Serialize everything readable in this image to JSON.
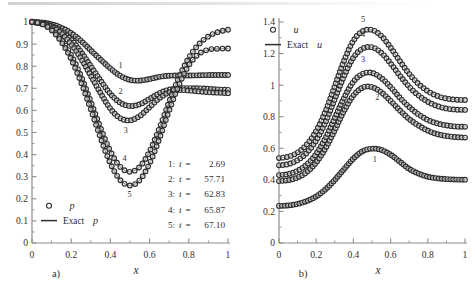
{
  "figure": {
    "panels": [
      {
        "id": "a",
        "panel_label": "a)",
        "xlabel": "x",
        "legend": [
          {
            "symbol": "o",
            "label": "p"
          },
          {
            "symbol": "line",
            "label": "Exact p"
          }
        ],
        "time_legend_rows": [
          {
            "index": "1:",
            "var": "t",
            "eq": "=",
            "value": "2.69"
          },
          {
            "index": "2:",
            "var": "t",
            "eq": "=",
            "value": "57.71"
          },
          {
            "index": "3:",
            "var": "t",
            "eq": "=",
            "value": "62.83"
          },
          {
            "index": "4:",
            "var": "t",
            "eq": "=",
            "value": "65.87"
          },
          {
            "index": "5:",
            "var": "t",
            "eq": "=",
            "value": "67.10"
          }
        ],
        "curve_numbers": [
          "1",
          "2",
          "3",
          "4",
          "5"
        ]
      },
      {
        "id": "b",
        "panel_label": "b)",
        "xlabel": "x",
        "legend": [
          {
            "symbol": "o",
            "label": "u"
          },
          {
            "symbol": "line",
            "label": "Exact u"
          }
        ],
        "curve_numbers": [
          "1",
          "2",
          "3",
          "4",
          "5"
        ]
      }
    ]
  },
  "chart_data": [
    {
      "type": "line",
      "panel": "a",
      "title": "",
      "xlabel": "x",
      "ylabel": "p",
      "xlim": [
        0,
        1
      ],
      "ylim": [
        0,
        1
      ],
      "xticks": [
        0,
        0.2,
        0.4,
        0.6,
        0.8,
        1
      ],
      "xticklabels": [
        "0",
        "0.2",
        "0.4",
        "0.6",
        "0.8",
        "1"
      ],
      "yticks": [
        0,
        0.1,
        0.2,
        0.3,
        0.4,
        0.5,
        0.6,
        0.7,
        0.8,
        0.9,
        1
      ],
      "yticklabels": [
        "0",
        "0.1",
        "0.2",
        "0.3",
        "0.4",
        "0.5",
        "0.6",
        "0.7",
        "0.8",
        "0.9",
        "1"
      ],
      "minor_xticks": [
        0.1,
        0.3,
        0.5,
        0.7,
        0.9
      ],
      "grid": false,
      "legend_position": "lower-left",
      "marker": "open-circle",
      "x": [
        0,
        0.05,
        0.1,
        0.15,
        0.2,
        0.25,
        0.3,
        0.35,
        0.4,
        0.45,
        0.5,
        0.55,
        0.6,
        0.65,
        0.7,
        0.75,
        0.8,
        0.85,
        0.9,
        0.95,
        1
      ],
      "series": [
        {
          "name": "1: t = 2.69",
          "values": [
            1.0,
            0.998,
            0.99,
            0.974,
            0.95,
            0.915,
            0.872,
            0.83,
            0.79,
            0.757,
            0.738,
            0.735,
            0.742,
            0.752,
            0.757,
            0.758,
            0.758,
            0.759,
            0.76,
            0.76,
            0.76
          ]
        },
        {
          "name": "2: t = 57.71",
          "values": [
            1.0,
            0.995,
            0.982,
            0.958,
            0.92,
            0.865,
            0.8,
            0.735,
            0.675,
            0.635,
            0.62,
            0.628,
            0.652,
            0.678,
            0.694,
            0.7,
            0.701,
            0.7,
            0.698,
            0.695,
            0.693
          ]
        },
        {
          "name": "3: t = 62.83",
          "values": [
            1.0,
            0.994,
            0.978,
            0.948,
            0.9,
            0.835,
            0.757,
            0.678,
            0.608,
            0.565,
            0.555,
            0.575,
            0.615,
            0.655,
            0.682,
            0.692,
            0.69,
            0.686,
            0.682,
            0.68,
            0.678
          ]
        },
        {
          "name": "4: t = 65.87",
          "values": [
            1.0,
            0.992,
            0.968,
            0.92,
            0.85,
            0.755,
            0.64,
            0.52,
            0.415,
            0.345,
            0.322,
            0.345,
            0.415,
            0.52,
            0.64,
            0.75,
            0.838,
            0.898,
            0.935,
            0.955,
            0.965
          ]
        },
        {
          "name": "5: t = 67.10",
          "values": [
            1.0,
            0.991,
            0.963,
            0.91,
            0.832,
            0.728,
            0.605,
            0.475,
            0.36,
            0.285,
            0.26,
            0.285,
            0.36,
            0.472,
            0.6,
            0.715,
            0.805,
            0.855,
            0.875,
            0.879,
            0.88
          ]
        }
      ]
    },
    {
      "type": "line",
      "panel": "b",
      "title": "",
      "xlabel": "x",
      "ylabel": "u",
      "xlim": [
        0,
        1
      ],
      "ylim": [
        0,
        1.4
      ],
      "xticks": [
        0,
        0.2,
        0.4,
        0.6,
        0.8,
        1
      ],
      "xticklabels": [
        "0",
        "0.2",
        "0.4",
        "0.6",
        "0.8",
        "1"
      ],
      "yticks": [
        0,
        0.2,
        0.4,
        0.6,
        0.8,
        1.0,
        1.2,
        1.4
      ],
      "yticklabels": [
        "0",
        "0.2",
        "0.4",
        "0.6",
        "0.8",
        "1",
        "1.2",
        "1.4"
      ],
      "minor_xticks": [
        0.1,
        0.3,
        0.5,
        0.7,
        0.9
      ],
      "grid": false,
      "legend_position": "upper-left",
      "marker": "open-circle",
      "x": [
        0,
        0.05,
        0.1,
        0.15,
        0.2,
        0.25,
        0.3,
        0.35,
        0.4,
        0.45,
        0.5,
        0.55,
        0.6,
        0.65,
        0.7,
        0.75,
        0.8,
        0.85,
        0.9,
        0.95,
        1
      ],
      "series": [
        {
          "name": "1",
          "values": [
            0.235,
            0.238,
            0.248,
            0.266,
            0.295,
            0.34,
            0.4,
            0.468,
            0.535,
            0.582,
            0.598,
            0.59,
            0.56,
            0.515,
            0.47,
            0.44,
            0.42,
            0.41,
            0.405,
            0.402,
            0.401
          ]
        },
        {
          "name": "2",
          "values": [
            0.392,
            0.398,
            0.415,
            0.45,
            0.51,
            0.6,
            0.715,
            0.838,
            0.935,
            0.985,
            0.988,
            0.955,
            0.9,
            0.84,
            0.785,
            0.745,
            0.712,
            0.69,
            0.678,
            0.671,
            0.668
          ]
        },
        {
          "name": "3",
          "values": [
            0.43,
            0.437,
            0.458,
            0.498,
            0.565,
            0.665,
            0.792,
            0.92,
            1.022,
            1.072,
            1.078,
            1.045,
            0.988,
            0.92,
            0.862,
            0.815,
            0.78,
            0.758,
            0.745,
            0.738,
            0.736
          ]
        },
        {
          "name": "4",
          "values": [
            0.492,
            0.5,
            0.525,
            0.572,
            0.65,
            0.765,
            0.912,
            1.058,
            1.175,
            1.232,
            1.24,
            1.205,
            1.138,
            1.06,
            0.99,
            0.935,
            0.895,
            0.868,
            0.852,
            0.845,
            0.843
          ]
        },
        {
          "name": "5",
          "values": [
            0.538,
            0.547,
            0.573,
            0.625,
            0.71,
            0.835,
            0.995,
            1.155,
            1.282,
            1.342,
            1.35,
            1.312,
            1.238,
            1.152,
            1.072,
            1.008,
            0.962,
            0.932,
            0.915,
            0.908,
            0.906
          ]
        }
      ]
    }
  ]
}
